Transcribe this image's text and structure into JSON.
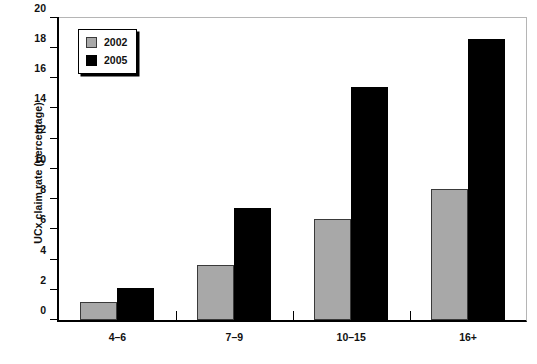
{
  "chart_data": {
    "type": "bar",
    "title": "",
    "xlabel": "",
    "ylabel": "UCx claim rate (percentage)",
    "categories": [
      "4–6",
      "7–9",
      "10–15",
      "16+"
    ],
    "series": [
      {
        "name": "2002",
        "color": "#a8a8a8",
        "values": [
          1.2,
          3.65,
          6.7,
          8.65
        ]
      },
      {
        "name": "2005",
        "color": "#000000",
        "values": [
          2.1,
          7.4,
          15.4,
          18.6
        ]
      }
    ],
    "ylim": [
      0,
      20
    ],
    "ytick_step": 2,
    "yticks": [
      0,
      2,
      4,
      6,
      8,
      10,
      12,
      14,
      16,
      18,
      20
    ],
    "ytick_labels": [
      "0",
      "2",
      "4",
      "6",
      "8",
      "10",
      "12",
      "14",
      "16",
      "18",
      "20"
    ],
    "grid": false,
    "legend_position": "top-left"
  },
  "legend": {
    "entries": [
      {
        "label": "2002",
        "swatch": "legend-swatch-2002"
      },
      {
        "label": "2005",
        "swatch": "legend-swatch-2005"
      }
    ]
  }
}
